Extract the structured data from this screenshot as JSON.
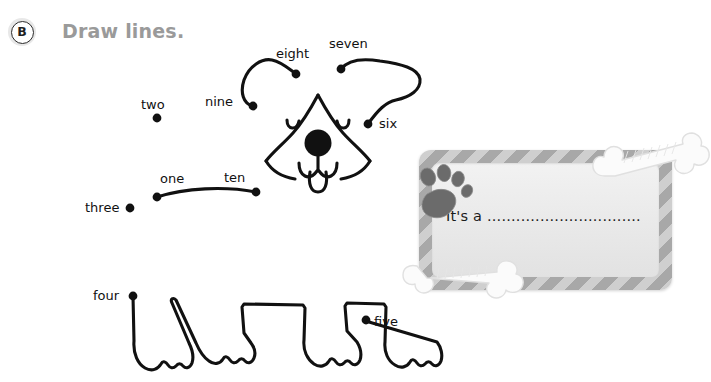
{
  "header": {
    "badge_letter": "B",
    "title": "Draw lines."
  },
  "puzzle": {
    "type": "dot-to-dot",
    "subject": "dog",
    "dot_color": "#111111",
    "line_color": "#111111",
    "dots": [
      {
        "id": "one",
        "label": "one",
        "label_x": 160,
        "label_y": 183,
        "dot_x": 157,
        "dot_y": 197
      },
      {
        "id": "two",
        "label": "two",
        "label_x": 141,
        "label_y": 109,
        "dot_x": 157,
        "dot_y": 118
      },
      {
        "id": "three",
        "label": "three",
        "label_x": 85,
        "label_y": 212,
        "dot_x": 130,
        "dot_y": 208
      },
      {
        "id": "four",
        "label": "four",
        "label_x": 93,
        "label_y": 300,
        "dot_x": 133,
        "dot_y": 296
      },
      {
        "id": "five",
        "label": "five",
        "label_x": 374,
        "label_y": 326,
        "dot_x": 366,
        "dot_y": 320
      },
      {
        "id": "six",
        "label": "six",
        "label_x": 379,
        "label_y": 128,
        "dot_x": 368,
        "dot_y": 124
      },
      {
        "id": "seven",
        "label": "seven",
        "label_x": 329,
        "label_y": 48,
        "dot_x": 341,
        "dot_y": 69
      },
      {
        "id": "eight",
        "label": "eight",
        "label_x": 276,
        "label_y": 58,
        "dot_x": 296,
        "dot_y": 74
      },
      {
        "id": "nine",
        "label": "nine",
        "label_x": 205,
        "label_y": 106,
        "dot_x": 253,
        "dot_y": 106
      },
      {
        "id": "ten",
        "label": "ten",
        "label_x": 224,
        "label_y": 182,
        "dot_x": 256,
        "dot_y": 192
      }
    ]
  },
  "card": {
    "prompt_text": "It's a ................................",
    "frame_color_light": "#cfcfcf",
    "frame_color_dark": "#a8a8a8",
    "inner_color": "#ededed",
    "paw_color": "#6b6b6b",
    "bone_color": "#fafafa",
    "paw_icon": "paw-print-icon",
    "bone_icon_top": "bone-icon",
    "bone_icon_bottom": "bone-icon"
  }
}
